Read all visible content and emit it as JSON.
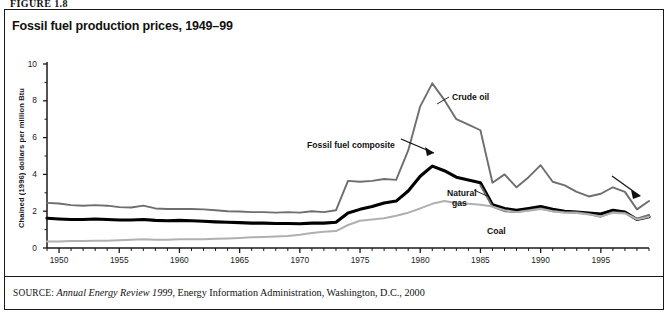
{
  "figure_label": "FIGURE 1.8",
  "title": "Fossil fuel production prices, 1949–99",
  "source": {
    "prefix": "SOURCE:",
    "italic_part": "Annual Energy Review 1999",
    "rest": ", Energy Information Administration, Washington, D.C., 2000"
  },
  "colors": {
    "crude_oil": "#6e6e6e",
    "fossil_fuel_composite": "#000000",
    "natural_gas": "#6e6e6e",
    "coal": "#b0b0b0",
    "axis": "#1a1a1a",
    "border": "#1a1a1a"
  },
  "annotations": [
    {
      "name": "crude-oil",
      "text": "Crude oil",
      "x": 452,
      "y": 92
    },
    {
      "name": "fossil-fuel-composite",
      "text": "Fossil fuel composite",
      "x": 307,
      "y": 140
    },
    {
      "name": "natural-gas-line1",
      "text": "Natural",
      "x": 447,
      "y": 188
    },
    {
      "name": "natural-gas-line2",
      "text": "gas",
      "x": 452,
      "y": 198
    },
    {
      "name": "coal",
      "text": "Coal",
      "x": 487,
      "y": 226
    }
  ],
  "chart_data": {
    "type": "line",
    "title": "Fossil fuel production prices, 1949–99",
    "xlabel": "",
    "ylabel": "Chained (1996) dollars per million Btu",
    "xlim": [
      1949,
      1999
    ],
    "ylim": [
      0,
      10
    ],
    "yticks": [
      0,
      2,
      4,
      6,
      8,
      10
    ],
    "xticks": [
      1950,
      1955,
      1960,
      1965,
      1970,
      1975,
      1980,
      1985,
      1990,
      1995
    ],
    "grid": false,
    "legend": "inline-annotations",
    "x": [
      1949,
      1950,
      1951,
      1952,
      1953,
      1954,
      1955,
      1956,
      1957,
      1958,
      1959,
      1960,
      1961,
      1962,
      1963,
      1964,
      1965,
      1966,
      1967,
      1968,
      1969,
      1970,
      1971,
      1972,
      1973,
      1974,
      1975,
      1976,
      1977,
      1978,
      1979,
      1980,
      1981,
      1982,
      1983,
      1984,
      1985,
      1986,
      1987,
      1988,
      1989,
      1990,
      1991,
      1992,
      1993,
      1994,
      1995,
      1996,
      1997,
      1998,
      1999
    ],
    "series": [
      {
        "name": "Crude oil",
        "color": "#6e6e6e",
        "width": 1.9,
        "values": [
          2.45,
          2.42,
          2.33,
          2.3,
          2.33,
          2.3,
          2.22,
          2.2,
          2.3,
          2.15,
          2.12,
          2.12,
          2.12,
          2.1,
          2.05,
          2.0,
          1.98,
          1.95,
          1.95,
          1.92,
          1.95,
          1.92,
          2.0,
          1.95,
          2.05,
          3.65,
          3.6,
          3.65,
          3.75,
          3.7,
          5.3,
          7.7,
          8.95,
          8.05,
          7.0,
          6.7,
          6.4,
          3.55,
          4.0,
          3.3,
          3.85,
          4.5,
          3.6,
          3.4,
          3.05,
          2.8,
          2.95,
          3.3,
          3.05,
          2.1,
          2.55
        ]
      },
      {
        "name": "Fossil fuel composite",
        "color": "#000000",
        "width": 3.1,
        "values": [
          1.62,
          1.58,
          1.55,
          1.55,
          1.58,
          1.55,
          1.52,
          1.52,
          1.55,
          1.5,
          1.48,
          1.5,
          1.48,
          1.45,
          1.42,
          1.4,
          1.38,
          1.35,
          1.35,
          1.33,
          1.33,
          1.32,
          1.35,
          1.35,
          1.4,
          1.9,
          2.1,
          2.25,
          2.45,
          2.55,
          3.1,
          3.9,
          4.45,
          4.2,
          3.85,
          3.7,
          3.55,
          2.35,
          2.15,
          2.05,
          2.15,
          2.25,
          2.1,
          2.0,
          1.95,
          1.9,
          1.85,
          2.05,
          1.95,
          1.55,
          1.7
        ]
      },
      {
        "name": "Natural gas",
        "color": "#6e6e6e",
        "width": 1.9,
        "values": [
          null,
          null,
          null,
          null,
          null,
          null,
          null,
          null,
          null,
          null,
          null,
          null,
          null,
          null,
          null,
          null,
          null,
          null,
          null,
          null,
          null,
          null,
          null,
          null,
          null,
          null,
          null,
          null,
          null,
          null,
          null,
          null,
          null,
          null,
          null,
          null,
          3.4,
          2.25,
          2.0,
          1.95,
          2.05,
          2.15,
          2.0,
          1.95,
          1.95,
          1.85,
          1.7,
          1.95,
          1.9,
          1.6,
          1.8
        ]
      },
      {
        "name": "Coal",
        "color": "#b0b0b0",
        "width": 2.0,
        "values": [
          0.35,
          0.36,
          0.38,
          0.38,
          0.4,
          0.4,
          0.42,
          0.45,
          0.48,
          0.45,
          0.45,
          0.48,
          0.48,
          0.48,
          0.5,
          0.52,
          0.55,
          0.58,
          0.6,
          0.62,
          0.65,
          0.72,
          0.82,
          0.88,
          0.92,
          1.25,
          1.48,
          1.55,
          1.62,
          1.75,
          1.92,
          2.15,
          2.4,
          2.55,
          2.45,
          2.4,
          2.35,
          2.25,
          2.05,
          1.95,
          2.02,
          2.12,
          2.0,
          1.92,
          1.9,
          1.82,
          1.72,
          1.92,
          1.88,
          1.55,
          1.7
        ]
      }
    ]
  }
}
